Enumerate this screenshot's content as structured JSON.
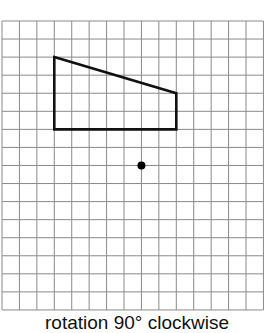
{
  "diagram": {
    "caption": "rotation 90° clockwise",
    "grid": {
      "columns": 15,
      "rows": 16,
      "origin_px": [
        2,
        21
      ],
      "cell_w": 17.43,
      "cell_h": 18.06,
      "line_color": "#8a8a8a"
    },
    "shape": {
      "type": "quadrilateral",
      "vertices_grid": [
        [
          3,
          2
        ],
        [
          10,
          4
        ],
        [
          10,
          6
        ],
        [
          3,
          6
        ]
      ],
      "stroke_color": "#111111"
    },
    "center_of_rotation": {
      "point_grid": [
        8,
        8
      ],
      "color": "#000000"
    }
  }
}
